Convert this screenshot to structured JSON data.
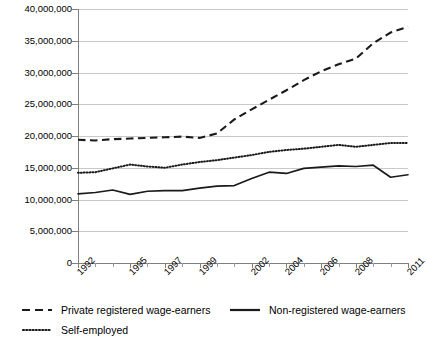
{
  "figure": {
    "partial_title": "",
    "background": "#ffffff",
    "line_color": "#1a1a1a",
    "grid_color": "#c9c9c9",
    "axis_color": "#7f7f7f"
  },
  "chart_data": {
    "type": "line",
    "title": "",
    "xlabel": "",
    "ylabel": "",
    "grid": true,
    "legend_position": "bottom",
    "ylim": [
      0,
      40000000
    ],
    "ytick_values": [
      0,
      5000000,
      10000000,
      15000000,
      20000000,
      25000000,
      30000000,
      35000000,
      40000000
    ],
    "ytick_labels": [
      "0",
      "5,000,000",
      "10,000,000",
      "15,000,000",
      "20,000,000",
      "25,000,000",
      "30,000,000",
      "35,000,000",
      "40,000,000"
    ],
    "x": [
      1992,
      1993,
      1994,
      1995,
      1996,
      1997,
      1998,
      1999,
      2000,
      2001,
      2002,
      2003,
      2004,
      2005,
      2006,
      2007,
      2008,
      2009,
      2010,
      2011
    ],
    "xtick_labels": [
      "1992",
      "",
      "",
      "1995",
      "",
      "1997",
      "",
      "1999",
      "",
      "",
      "2002",
      "",
      "2004",
      "",
      "2006",
      "",
      "2008",
      "",
      "",
      "2011"
    ],
    "xtick_labels_shown": [
      "1992",
      "1995",
      "1997",
      "1999",
      "2002",
      "2004",
      "2006",
      "2008",
      "2011"
    ],
    "series": [
      {
        "name": "Private registered wage-earners",
        "style": "dashed",
        "values": [
          19400000,
          19300000,
          19500000,
          19600000,
          19700000,
          19800000,
          19900000,
          19700000,
          20400000,
          22600000,
          24200000,
          25700000,
          27200000,
          28800000,
          30200000,
          31300000,
          32200000,
          34600000,
          36300000,
          37200000
        ]
      },
      {
        "name": "Non-registered wage-earners",
        "style": "solid",
        "values": [
          10900000,
          11100000,
          11500000,
          10800000,
          11300000,
          11400000,
          11400000,
          11800000,
          12100000,
          12200000,
          13300000,
          14300000,
          14100000,
          14900000,
          15100000,
          15300000,
          15200000,
          15400000,
          13500000,
          13900000
        ]
      },
      {
        "name": "Self-employed",
        "style": "dotted",
        "values": [
          14200000,
          14300000,
          14900000,
          15500000,
          15200000,
          15000000,
          15500000,
          15900000,
          16200000,
          16600000,
          17000000,
          17500000,
          17800000,
          18000000,
          18300000,
          18600000,
          18300000,
          18600000,
          18900000,
          18900000
        ]
      }
    ]
  },
  "legend": {
    "items": [
      {
        "label": "Private registered wage-earners",
        "style": "dashed"
      },
      {
        "label": "Non-registered wage-earners",
        "style": "solid"
      },
      {
        "label": "Self-employed",
        "style": "dotted"
      }
    ]
  }
}
